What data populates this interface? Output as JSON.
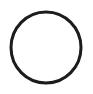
{
  "canvas": {
    "width": 93,
    "height": 94,
    "background_color": "#ffffff",
    "title": "Circle outline"
  },
  "figure": {
    "type": "line-drawing",
    "caption": "Circle",
    "shape_name": "circle-outline",
    "stroke_color": "#1a1a1a",
    "fill_color": "none",
    "stroke_width": 3,
    "center_x": 46,
    "center_y": 47.5,
    "radius_x": 36.5,
    "radius_y": 37,
    "outer_diameter_px": 76,
    "antialias_blur_px": 0.35
  }
}
